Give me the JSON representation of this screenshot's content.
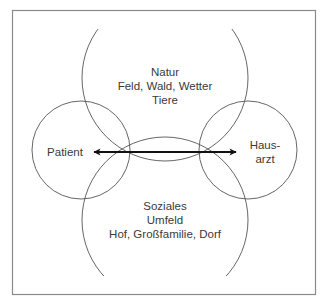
{
  "diagram": {
    "frame": {
      "x": 12,
      "y": 10,
      "w": 304,
      "h": 285,
      "stroke": "#8a8a8a"
    },
    "circles": {
      "natur": {
        "cx": 165,
        "cy": 78,
        "r": 83,
        "lines": [
          "Natur",
          "Feld, Wald, Wetter",
          "Tiere"
        ]
      },
      "soziales": {
        "cx": 165,
        "cy": 220,
        "r": 83,
        "lines": [
          "Soziales",
          "Umfeld",
          "Hof, Großfamilie, Dorf"
        ]
      },
      "patient": {
        "cx": 81,
        "cy": 150,
        "r": 49,
        "label": "Patient"
      },
      "hausarzt": {
        "cx": 248,
        "cy": 150,
        "r": 49,
        "lines": [
          "Haus-",
          "arzt"
        ]
      }
    },
    "arrow": {
      "x1": 93,
      "x2": 236,
      "y": 152,
      "type": "bidirectional"
    },
    "colors": {
      "line": "#555555",
      "arrow": "#111111",
      "text": "#3a3a3a"
    }
  }
}
